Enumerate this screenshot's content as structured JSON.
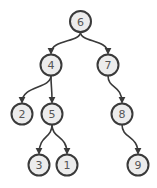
{
  "diagram": {
    "type": "binary-tree",
    "colors": {
      "node_fill": "#ececec",
      "node_stroke": "#3a3a3a",
      "label": "#555555",
      "edge": "#3a3a3a",
      "background": "#ffffff"
    },
    "nodes": [
      {
        "id": "n6",
        "label": "6",
        "x": 80.5,
        "y": 21.5
      },
      {
        "id": "n4",
        "label": "4",
        "x": 51,
        "y": 65
      },
      {
        "id": "n7",
        "label": "7",
        "x": 108,
        "y": 65
      },
      {
        "id": "n2",
        "label": "2",
        "x": 22,
        "y": 114
      },
      {
        "id": "n5",
        "label": "5",
        "x": 52,
        "y": 114
      },
      {
        "id": "n8",
        "label": "8",
        "x": 122,
        "y": 114
      },
      {
        "id": "n3",
        "label": "3",
        "x": 39,
        "y": 165
      },
      {
        "id": "n1",
        "label": "1",
        "x": 67,
        "y": 165
      },
      {
        "id": "n9",
        "label": "9",
        "x": 138,
        "y": 165
      }
    ],
    "edges": [
      {
        "from": "n6",
        "to": "n4"
      },
      {
        "from": "n6",
        "to": "n7"
      },
      {
        "from": "n4",
        "to": "n2"
      },
      {
        "from": "n4",
        "to": "n5"
      },
      {
        "from": "n7",
        "to": "n8"
      },
      {
        "from": "n5",
        "to": "n3"
      },
      {
        "from": "n5",
        "to": "n1"
      },
      {
        "from": "n8",
        "to": "n9"
      }
    ],
    "node_radius": 10.5
  }
}
